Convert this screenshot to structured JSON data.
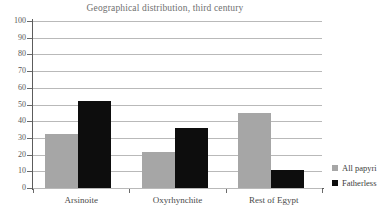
{
  "chart_data": {
    "type": "bar",
    "title": "Geographical distribution, third century",
    "xlabel": "",
    "ylabel": "",
    "categories": [
      "Arsinoite",
      "Oxyrhynchite",
      "Rest of Egypt"
    ],
    "series": [
      {
        "name": "All papyri",
        "color": "#a6a6a6",
        "values": [
          32.5,
          21.5,
          45
        ]
      },
      {
        "name": "Fatherless",
        "color": "#0d0d0d",
        "values": [
          52,
          36,
          11
        ]
      }
    ],
    "ylim": [
      0,
      100
    ],
    "ytick_step": 10,
    "yticks": [
      100,
      90,
      80,
      70,
      60,
      50,
      40,
      30,
      20,
      10,
      0
    ],
    "ytick_labels": [
      "100",
      "90",
      "80",
      "70",
      "60",
      "50",
      "40",
      "30",
      "20",
      "10",
      "0"
    ],
    "grid": true,
    "grid_axis": "y",
    "legend_position": "right",
    "axis_color": "#5c5c5c",
    "grid_color": "#b9b9b9",
    "background": "#ffffff"
  }
}
